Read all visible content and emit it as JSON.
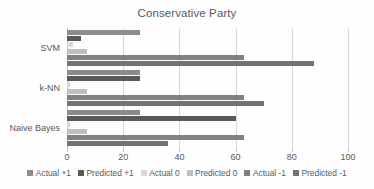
{
  "chart_data": {
    "type": "bar",
    "orientation": "horizontal",
    "title": "Conservative Party",
    "xlabel": "",
    "ylabel": "",
    "categories": [
      "SVM",
      "k-NN",
      "Naive Bayes"
    ],
    "series": [
      {
        "name": "Actual +1",
        "color": "#8c8c8c",
        "values": [
          26,
          26,
          26
        ]
      },
      {
        "name": "Predicted +1",
        "color": "#595959",
        "values": [
          5,
          26,
          60
        ]
      },
      {
        "name": "Actual 0",
        "color": "#d9d9d9",
        "values": [
          2,
          1,
          1
        ]
      },
      {
        "name": "Predicted 0",
        "color": "#bfbfbf",
        "values": [
          7,
          7,
          7
        ]
      },
      {
        "name": "Actual -1",
        "color": "#808080",
        "values": [
          63,
          63,
          63
        ]
      },
      {
        "name": "Predicted -1",
        "color": "#737373",
        "values": [
          88,
          70,
          36
        ]
      }
    ],
    "xlim": [
      0,
      100
    ],
    "xticks": [
      0,
      20,
      40,
      60,
      80,
      100
    ],
    "xtick_labels": [
      "0",
      "20",
      "40",
      "60",
      "80",
      "100"
    ],
    "grid": true,
    "legend_position": "bottom"
  }
}
